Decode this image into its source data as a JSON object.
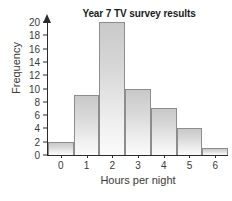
{
  "chart_data": {
    "type": "bar",
    "title": "Year 7 TV survey results",
    "xlabel": "Hours per night",
    "ylabel": "Frequency",
    "categories": [
      "0",
      "1",
      "2",
      "3",
      "4",
      "5",
      "6"
    ],
    "values": [
      2,
      9,
      20,
      10,
      7,
      4,
      1
    ],
    "ylim": [
      0,
      20
    ],
    "ytick_values": [
      0,
      2,
      4,
      6,
      8,
      10,
      12,
      14,
      16,
      18,
      20
    ],
    "ytick_labels": [
      "0",
      "2",
      "4",
      "6",
      "8",
      "10",
      "12",
      "14",
      "16",
      "18",
      "20"
    ],
    "grid": false,
    "legend": null,
    "bars_touching": true,
    "colors": {
      "bar_fill_top": "#c9c9c9",
      "bar_fill_bottom": "#fbfbfb",
      "bar_border": "#8d8d8d",
      "axis": "#2b2b2b",
      "text": "#3a3a3a",
      "title_text": "#1c1c1c",
      "background": "#ffffff"
    }
  }
}
